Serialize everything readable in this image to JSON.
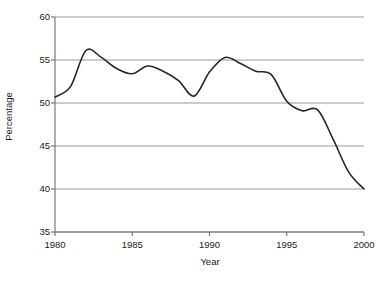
{
  "chart_data": {
    "type": "line",
    "title": "",
    "xlabel": "Year",
    "ylabel": "Percentage",
    "xlim": [
      1980,
      2000
    ],
    "ylim": [
      35,
      60
    ],
    "xticks": [
      1980,
      1985,
      1990,
      1995,
      2000
    ],
    "yticks": [
      35,
      40,
      45,
      50,
      55,
      60
    ],
    "xtick_labels": [
      "1980",
      "1985",
      "1990",
      "1995",
      "2000"
    ],
    "ytick_labels": [
      "35",
      "40",
      "45",
      "50",
      "55",
      "60"
    ],
    "grid": "horizontal",
    "legend": "none",
    "series": [
      {
        "name": "Percentage",
        "color": "#262626",
        "x": [
          1980,
          1981,
          1982,
          1983,
          1984,
          1985,
          1986,
          1987,
          1988,
          1989,
          1990,
          1991,
          1992,
          1993,
          1994,
          1995,
          1996,
          1997,
          1998,
          1999,
          2000
        ],
        "values": [
          50.7,
          51.9,
          56.1,
          55.3,
          54.0,
          53.4,
          54.3,
          53.7,
          52.6,
          50.8,
          53.6,
          55.3,
          54.6,
          53.7,
          53.3,
          50.2,
          49.1,
          49.2,
          45.8,
          42.0,
          40.0
        ]
      }
    ],
    "style": {
      "line_color": "#262626",
      "line_width": 1.6,
      "grid_color": "#9a9a9a",
      "axis_color": "#6e6e6e",
      "background": "#ffffff"
    }
  }
}
